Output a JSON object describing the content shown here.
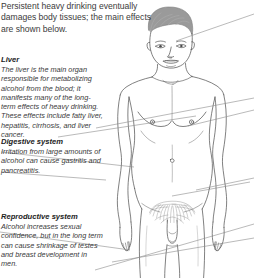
{
  "intro": {
    "text": "Persistent heavy drinking eventually damages body tissues; the main effects are shown below."
  },
  "callouts": [
    {
      "id": "liver",
      "heading": "Liver",
      "body": "The liver is the main organ responsible for metabolizing alcohol from the blood; it manifests many of the long-term effects of heavy drinking. These effects include fatty liver, hepatitis, cirrhosis, and liver cancer."
    },
    {
      "id": "digestive",
      "heading": "Digestive system",
      "body": "Irritation from large amounts of alcohol can cause gastritis and pancreatitis."
    },
    {
      "id": "reproductive",
      "heading": "Reproductive system",
      "body": "Alcohol increases sexual confidence, but in the long term can cause shrinkage of testes and breast development in men."
    }
  ],
  "figure": {
    "name": "male-anatomical-figure",
    "colors": {
      "outline": "#4a4a4a",
      "hair": "#9a9a9a",
      "leader_line": "#8c8c8c",
      "background": "#ffffff"
    }
  }
}
